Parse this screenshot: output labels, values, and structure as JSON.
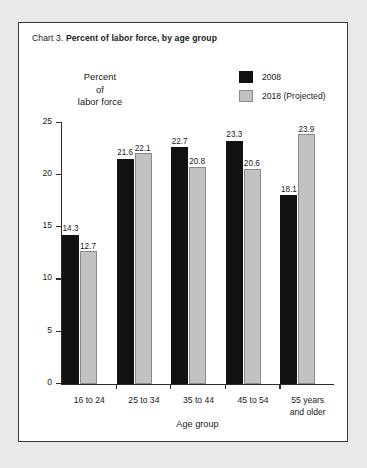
{
  "figure": {
    "label": "Chart 3.",
    "title": "Percent of labor force, by age group"
  },
  "axis_titles": {
    "y_line1": "Percent",
    "y_line2": "of",
    "y_line3": "labor force",
    "x": "Age group"
  },
  "legend": {
    "items": [
      {
        "label": "2008",
        "color": "#111111",
        "style": "solid-dark"
      },
      {
        "label": "2018 (Projected)",
        "color": "#c2c2c2",
        "style": "solid-light"
      }
    ]
  },
  "chart_data": {
    "type": "bar",
    "title": "Chart 3. Percent of labor force, by age group",
    "xlabel": "Age group",
    "ylabel": "Percent of labor force",
    "ylim": [
      0,
      25
    ],
    "yticks": [
      "0",
      "5",
      "10",
      "15",
      "20",
      "25"
    ],
    "grid": false,
    "legend_position": "top-right",
    "categories": [
      "16 to 24",
      "25 to 34",
      "35 to 44",
      "45 to 54",
      "55 years and older"
    ],
    "category_lines": [
      [
        "16 to 24"
      ],
      [
        "25 to 34"
      ],
      [
        "35 to 44"
      ],
      [
        "45 to 54"
      ],
      [
        "55 years",
        "and older"
      ]
    ],
    "series": [
      {
        "name": "2008",
        "color": "#111111",
        "values": [
          14.3,
          21.6,
          22.7,
          23.3,
          18.1
        ]
      },
      {
        "name": "2018 (Projected)",
        "color": "#c2c2c2",
        "values": [
          12.7,
          22.1,
          20.8,
          20.6,
          23.9
        ]
      }
    ],
    "value_labels": {
      "2008": [
        "14.3",
        "21.6",
        "22.7",
        "23.3",
        "18.1"
      ],
      "2018 (Projected)": [
        "12.7",
        "22.1",
        "20.8",
        "20.6",
        "23.9"
      ]
    }
  }
}
